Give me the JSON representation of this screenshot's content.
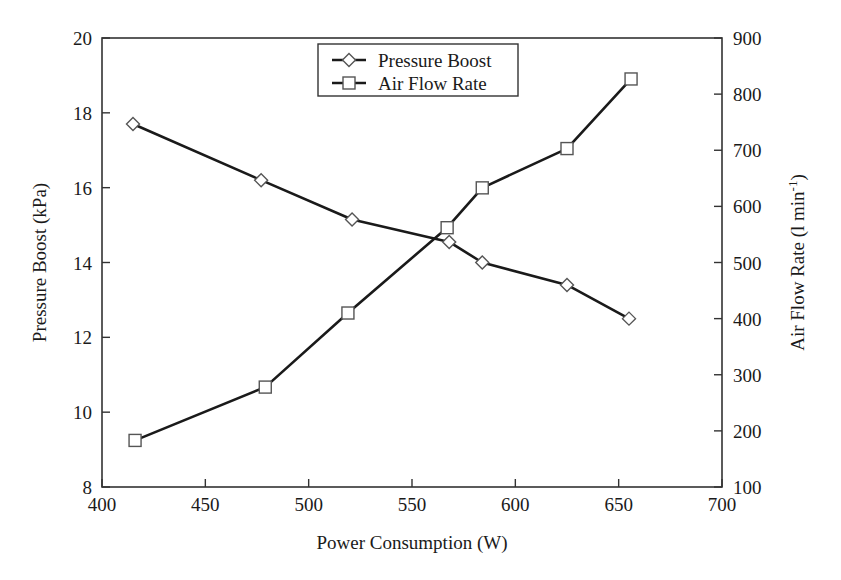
{
  "chart_data": {
    "type": "line",
    "title": "",
    "xlabel": "Power Consumption (W)",
    "ylabel": "Pressure Boost (kPa)",
    "y2label": "Air Flow Rate (l min",
    "y2label_sup": "-1",
    "y2label_end": ")",
    "xlim": [
      400,
      700
    ],
    "ylim": [
      8,
      20
    ],
    "y2lim": [
      100,
      900
    ],
    "grid": false,
    "legend_position": "top-center",
    "xticks": [
      "400",
      "450",
      "500",
      "550",
      "600",
      "650",
      "700"
    ],
    "xtick_values": [
      400,
      450,
      500,
      550,
      600,
      650,
      700
    ],
    "yticks": [
      "8",
      "10",
      "12",
      "14",
      "16",
      "18",
      "20"
    ],
    "ytick_values": [
      8,
      10,
      12,
      14,
      16,
      18,
      20
    ],
    "y2ticks": [
      "100",
      "200",
      "300",
      "400",
      "500",
      "600",
      "700",
      "800",
      "900"
    ],
    "y2tick_values": [
      100,
      200,
      300,
      400,
      500,
      600,
      700,
      800,
      900
    ],
    "series": [
      {
        "name": "Pressure Boost",
        "axis": "left",
        "marker": "diamond",
        "x": [
          415,
          477,
          521,
          568,
          584,
          625,
          655
        ],
        "values": [
          17.7,
          16.2,
          15.15,
          14.55,
          14.0,
          13.4,
          12.5
        ]
      },
      {
        "name": "Air Flow Rate",
        "axis": "right",
        "marker": "square",
        "x": [
          416,
          479,
          519,
          567,
          584,
          625,
          656
        ],
        "values": [
          183,
          278,
          410,
          562,
          633,
          703,
          827
        ]
      }
    ]
  },
  "legend": {
    "entries": [
      {
        "label": "Pressure Boost",
        "marker": "diamond"
      },
      {
        "label": "Air Flow Rate",
        "marker": "square"
      }
    ]
  },
  "colors": {
    "line": "#1a1a1a",
    "axis": "#333333",
    "marker_fill": "#ffffff",
    "marker_stroke": "#555555",
    "background": "#ffffff"
  }
}
